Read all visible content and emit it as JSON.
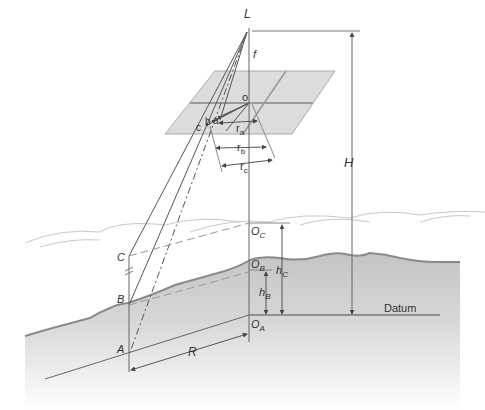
{
  "diagram": {
    "labels": {
      "L": "L",
      "f": "f",
      "o": "o",
      "a": "a",
      "b": "b",
      "c": "c",
      "ra": "r",
      "ra_sub": "a",
      "rb": "r",
      "rb_sub": "b",
      "rc": "r",
      "rc_sub": "c",
      "H": "H",
      "C": "C",
      "B": "B",
      "A": "A",
      "OC": "O",
      "OC_sub": "C",
      "OB": "O",
      "OB_sub": "B",
      "OA": "O",
      "OA_sub": "A",
      "hB": "h",
      "hB_sub": "B",
      "hC": "h",
      "hC_sub": "C",
      "R": "R",
      "datum": "Datum"
    },
    "colors": {
      "line": "#555555",
      "photo_plane": "#d9d9d9",
      "photo_plane_grid": "#9a9a9a",
      "ground_fill_top": "#c8c8c8",
      "ground_edge": "#8a8a8a",
      "cloud_line": "#c0c0c0"
    }
  }
}
